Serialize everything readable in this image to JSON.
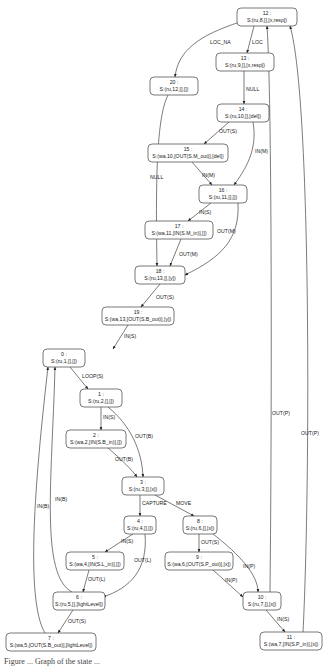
{
  "diagram": {
    "type": "state-transition-graph",
    "nodes": [
      {
        "id": "12",
        "num": "12 :",
        "label": "S:(ru,8,[],[x,resp])",
        "x": 237,
        "y": 8,
        "w": 60,
        "h": 18
      },
      {
        "id": "13",
        "num": "13 :",
        "label": "S:(ru,9,[],[x,resp])",
        "x": 216,
        "y": 53,
        "w": 58,
        "h": 18
      },
      {
        "id": "20",
        "num": "20 :",
        "label": "S:(ru,12,[],[])",
        "x": 150,
        "y": 77,
        "w": 48,
        "h": 18
      },
      {
        "id": "14",
        "num": "14 :",
        "label": "S:(ru,10,[],[del])",
        "x": 217,
        "y": 104,
        "w": 52,
        "h": 18
      },
      {
        "id": "15",
        "num": "15 :",
        "label": "S:(wa,10,[OUT(S.M_out)],[del])",
        "x": 148,
        "y": 144,
        "w": 80,
        "h": 18
      },
      {
        "id": "16",
        "num": "16 :",
        "label": "S:(ru,11,[],[])",
        "x": 199,
        "y": 185,
        "w": 48,
        "h": 18
      },
      {
        "id": "17",
        "num": "17 :",
        "label": "S:(wa,11,[IN(S.M_in)],[])",
        "x": 145,
        "y": 221,
        "w": 68,
        "h": 18
      },
      {
        "id": "18",
        "num": "18 :",
        "label": "S:(ru,13,[],[y])",
        "x": 135,
        "y": 266,
        "w": 50,
        "h": 18
      },
      {
        "id": "19",
        "num": "19 :",
        "label": "S:(wa,13,[OUT(S.B_out)],[y])",
        "x": 102,
        "y": 307,
        "w": 72,
        "h": 18
      },
      {
        "id": "0",
        "num": "0 :",
        "label": "S:(ru,1,[],[])",
        "x": 43,
        "y": 349,
        "w": 42,
        "h": 18
      },
      {
        "id": "1",
        "num": "1 :",
        "label": "S:(ru,2,[],[])",
        "x": 80,
        "y": 389,
        "w": 42,
        "h": 18
      },
      {
        "id": "2",
        "num": "2 :",
        "label": "S:(wa,2,[IN(S.B_in)],[])",
        "x": 66,
        "y": 430,
        "w": 60,
        "h": 18
      },
      {
        "id": "3",
        "num": "3 :",
        "label": "S:(ru,3,[],[x])",
        "x": 122,
        "y": 477,
        "w": 42,
        "h": 18
      },
      {
        "id": "4",
        "num": "4 :",
        "label": "S:(ru,4,[],[])",
        "x": 124,
        "y": 516,
        "w": 32,
        "h": 18
      },
      {
        "id": "8",
        "num": "8 :",
        "label": "S:(ru,6,[],[x])",
        "x": 183,
        "y": 516,
        "w": 34,
        "h": 18
      },
      {
        "id": "5",
        "num": "5 :",
        "label": "S:(wa,4,[IN(S.L_in)],[])",
        "x": 66,
        "y": 552,
        "w": 58,
        "h": 18
      },
      {
        "id": "9",
        "num": "9 :",
        "label": "S:(wa,6,[OUT(S.P_out)],[x])",
        "x": 165,
        "y": 552,
        "w": 68,
        "h": 18
      },
      {
        "id": "6",
        "num": "6 :",
        "label": "S:(ru,5,[],[lightLevel])",
        "x": 53,
        "y": 592,
        "w": 52,
        "h": 18
      },
      {
        "id": "10",
        "num": "10 :",
        "label": "S:(ru,7,[],[x])",
        "x": 243,
        "y": 592,
        "w": 38,
        "h": 18
      },
      {
        "id": "7",
        "num": "7 :",
        "label": "S:(wa,5,[OUT(S.B_out)],[lightLevel])",
        "x": 6,
        "y": 633,
        "w": 90,
        "h": 18
      },
      {
        "id": "11",
        "num": "11 :",
        "label": "S:(wa,7,[IN(S.P_in)],[x])",
        "x": 260,
        "y": 632,
        "w": 62,
        "h": 18
      }
    ],
    "edges": [
      {
        "from": "12",
        "to": "20",
        "label": "LOC_NA"
      },
      {
        "from": "12",
        "to": "13",
        "label": "LOC"
      },
      {
        "from": "13",
        "to": "14",
        "label": "NULL"
      },
      {
        "from": "14",
        "to": "15",
        "label": "OUT(S)"
      },
      {
        "from": "14",
        "to": "16",
        "label": "IN(M)"
      },
      {
        "from": "15",
        "to": "16",
        "label": "IN(M)"
      },
      {
        "from": "20",
        "to": "18",
        "label": "NULL"
      },
      {
        "from": "16",
        "to": "17",
        "label": "IN(S)"
      },
      {
        "from": "16",
        "to": "18",
        "label": "OUT(M)"
      },
      {
        "from": "17",
        "to": "18",
        "label": "OUT(M)"
      },
      {
        "from": "18",
        "to": "19",
        "label": "OUT(S)"
      },
      {
        "from": "19",
        "to": "0",
        "label": "IN(S)"
      },
      {
        "from": "0",
        "to": "1",
        "label": "LOOP(S)"
      },
      {
        "from": "1",
        "to": "2",
        "label": "IN(S)"
      },
      {
        "from": "1",
        "to": "3",
        "label": "OUT(B)"
      },
      {
        "from": "2",
        "to": "3",
        "label": "OUT(B)"
      },
      {
        "from": "3",
        "to": "4",
        "label": "CAPTURE"
      },
      {
        "from": "3",
        "to": "8",
        "label": "MOVE"
      },
      {
        "from": "4",
        "to": "5",
        "label": "IN(S)"
      },
      {
        "from": "4",
        "to": "6",
        "label": "OUT(L)"
      },
      {
        "from": "5",
        "to": "6",
        "label": "OUT(L)"
      },
      {
        "from": "8",
        "to": "9",
        "label": "OUT(S)"
      },
      {
        "from": "8",
        "to": "10",
        "label": "IN(P)"
      },
      {
        "from": "9",
        "to": "10",
        "label": "IN(P)"
      },
      {
        "from": "6",
        "to": "7",
        "label": "OUT(S)"
      },
      {
        "from": "6",
        "to": "0",
        "label": "IN(B)"
      },
      {
        "from": "7",
        "to": "0",
        "label": "IN(B)"
      },
      {
        "from": "10",
        "to": "11",
        "label": "IN(S)"
      },
      {
        "from": "10",
        "to": "12",
        "label": "OUT(P)"
      },
      {
        "from": "11",
        "to": "12",
        "label": "OUT(P)"
      }
    ]
  },
  "caption": "Figure ... Graph of the state ..."
}
